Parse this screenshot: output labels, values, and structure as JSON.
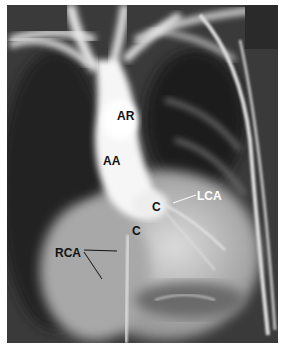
{
  "figure": {
    "labels": [
      {
        "id": "ar",
        "text": "AR",
        "x": 117,
        "y": 110,
        "color": "dark"
      },
      {
        "id": "aa",
        "text": "AA",
        "x": 103,
        "y": 155,
        "color": "dark"
      },
      {
        "id": "c1",
        "text": "C",
        "x": 152,
        "y": 201,
        "color": "dark"
      },
      {
        "id": "c2",
        "text": "C",
        "x": 132,
        "y": 225,
        "color": "dark"
      },
      {
        "id": "lca",
        "text": "LCA",
        "x": 197,
        "y": 190,
        "color": "light"
      },
      {
        "id": "rca",
        "text": "RCA",
        "x": 55,
        "y": 247,
        "color": "dark"
      }
    ],
    "colors": {
      "border": "#ffffff",
      "lung_dark": "#1e1e1e",
      "aorta_bright": "#f4f4f4",
      "heart_mid": "#c8c8c8"
    }
  }
}
